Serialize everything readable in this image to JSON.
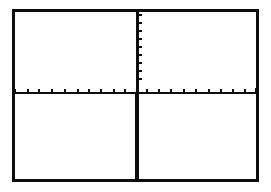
{
  "graph_screen": {
    "type": "calculator-graph-window",
    "content": "empty coordinate axes with tick marks",
    "colors": {
      "background": "#ffffff",
      "foreground": "#0d0d0d"
    },
    "x_axis": {
      "tick_count_left": 10,
      "tick_count_right": 10,
      "tick_positions_px": [
        14,
        27,
        38,
        51,
        64,
        77,
        88,
        100,
        113,
        124,
        146,
        158,
        170,
        183,
        195,
        208,
        220,
        232,
        244
      ]
    },
    "y_axis": {
      "tick_count_above": 9,
      "tick_positions_px": [
        14,
        22,
        30,
        38,
        46,
        54,
        62,
        70,
        78
      ]
    }
  }
}
